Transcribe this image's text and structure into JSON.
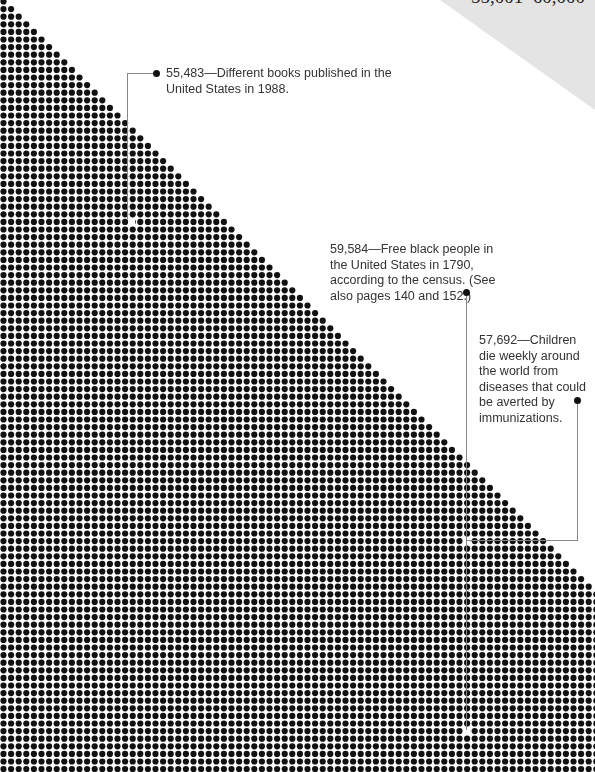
{
  "range_label": "55,001–60,000",
  "grid": {
    "pitch": 7.6,
    "dot_radius": 3.1,
    "dot_color": "#111111",
    "start_x": 3.5,
    "start_y": 1.5,
    "diagonal_offset": -4
  },
  "annotations": [
    {
      "value": "55,483",
      "text": "55,483—Different books published in the United States in 1988."
    },
    {
      "value": "59,584",
      "text": "59,584—Free black people in the United States in 1790, according to the census. (See also pages 140 and 152.)"
    },
    {
      "value": "57,692",
      "text": "57,692—Children die weekly around the world from diseases that could be averted by immunizations."
    }
  ]
}
